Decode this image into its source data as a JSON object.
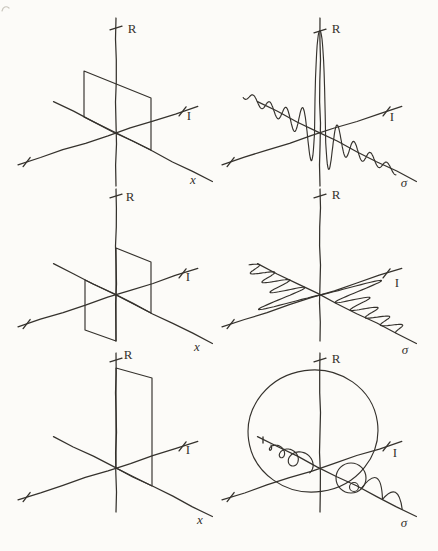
{
  "figure": {
    "background": "#fcfbf8",
    "ink": "#35322d",
    "grid": {
      "columns": 2,
      "rows": 3
    },
    "panels": [
      {
        "name": "even-rectangle-signal",
        "origin": [
          116,
          133
        ],
        "axes": {
          "r_up": 115,
          "r_down": 53,
          "i_pos": 86,
          "i_neg": 103,
          "d_pos": 108,
          "d_neg": 70
        },
        "ticks": {
          "r": -105,
          "i_pos": 70,
          "i_neg": -94
        },
        "labels": {
          "vertical": "R",
          "horizontal": "I",
          "depth": "x"
        },
        "label_pos": {
          "vertical": [
            16,
            -103
          ],
          "horizontal": [
            73,
            -16
          ],
          "depth": [
            77,
            48
          ]
        },
        "curve": {
          "kind": "polygon",
          "points": [
            [
              -32,
              -16
            ],
            [
              -32,
              -62
            ],
            [
              35,
              -35
            ],
            [
              35,
              17
            ]
          ]
        }
      },
      {
        "name": "sinc-transform",
        "origin": [
          320,
          133
        ],
        "axes": {
          "r_up": 115,
          "r_down": 53,
          "i_pos": 86,
          "i_neg": 103,
          "d_pos": 108,
          "d_neg": 70
        },
        "ticks": {
          "r": -102,
          "i_pos": 70,
          "i_neg": -94
        },
        "labels": {
          "vertical": "R",
          "horizontal": "I",
          "depth": "σ"
        },
        "label_pos": {
          "vertical": [
            16,
            -103
          ],
          "horizontal": [
            72,
            -15
          ],
          "depth": [
            84,
            51
          ]
        },
        "curve": {
          "kind": "spike-sinc",
          "amplitude": 102,
          "spike_half_width": 6,
          "zero_spacing": 9.2,
          "envelope": 3.2,
          "t_min": -86,
          "t_max": 85
        }
      },
      {
        "name": "odd-rectangle-signal",
        "origin": [
          116,
          295
        ],
        "axes": {
          "r_up": 106,
          "r_down": 46,
          "i_pos": 86,
          "i_neg": 103,
          "d_pos": 108,
          "d_neg": 70
        },
        "ticks": {
          "r": -99,
          "i_pos": 70,
          "i_neg": -94
        },
        "labels": {
          "vertical": "R",
          "horizontal": "I",
          "depth": "x"
        },
        "label_pos": {
          "vertical": [
            14,
            -97
          ],
          "horizontal": [
            72,
            -17
          ],
          "depth": [
            81,
            53
          ]
        },
        "curve": {
          "kind": "polygons",
          "polygons": [
            [
              [
                0,
                0
              ],
              [
                0,
                -47
              ],
              [
                35,
                -33
              ],
              [
                35,
                18
              ]
            ],
            [
              [
                0,
                0
              ],
              [
                -31,
                -15
              ],
              [
                -31,
                35
              ],
              [
                0,
                46
              ]
            ]
          ]
        }
      },
      {
        "name": "odd-imaginary-transform",
        "origin": [
          320,
          295
        ],
        "axes": {
          "r_up": 106,
          "r_down": 46,
          "i_pos": 86,
          "i_neg": 103,
          "d_pos": 108,
          "d_neg": 70
        },
        "ticks": {
          "r": -99,
          "i_pos": 70,
          "i_neg": -94
        },
        "labels": {
          "vertical": "R",
          "horizontal": "I",
          "depth": "σ"
        },
        "label_pos": {
          "vertical": [
            16,
            -99
          ],
          "horizontal": [
            77,
            -11
          ],
          "depth": [
            85,
            56
          ]
        },
        "curve": {
          "kind": "odd-lobes",
          "amplitude": 55,
          "period": 17,
          "envelope_power": 0.6,
          "t_min": -72,
          "t_max": 84
        }
      },
      {
        "name": "step-rectangle-signal",
        "origin": [
          116,
          468
        ],
        "axes": {
          "r_up": 115,
          "r_down": 44,
          "i_pos": 86,
          "i_neg": 103,
          "d_pos": 108,
          "d_neg": 70
        },
        "ticks": {
          "r": -108,
          "i_pos": 70,
          "i_neg": -94
        },
        "labels": {
          "vertical": "R",
          "horizontal": "I",
          "depth": "x"
        },
        "label_pos": {
          "vertical": [
            12,
            -112
          ],
          "horizontal": [
            72,
            -17
          ],
          "depth": [
            84,
            53
          ]
        },
        "curve": {
          "kind": "polygon",
          "points": [
            [
              0,
              0
            ],
            [
              0,
              -100
            ],
            [
              36,
              -90
            ],
            [
              36,
              18
            ]
          ]
        }
      },
      {
        "name": "spiral-transform",
        "origin": [
          320,
          468
        ],
        "axes": {
          "r_up": 115,
          "r_down": 44,
          "i_pos": 86,
          "i_neg": 103,
          "d_pos": 108,
          "d_neg": 70
        },
        "ticks": {
          "r": -108,
          "i_pos": 70,
          "i_neg": -94
        },
        "labels": {
          "vertical": "R",
          "horizontal": "I",
          "depth": "σ"
        },
        "label_pos": {
          "vertical": [
            16,
            -108
          ],
          "horizontal": [
            75,
            -14
          ],
          "depth": [
            84,
            56
          ]
        },
        "curve": {
          "kind": "spiral",
          "big_loop": {
            "center": [
              -7,
              -37
            ],
            "rx": 65,
            "ry": 61,
            "rotation": -8
          },
          "corkscrew": {
            "t_start": -17,
            "advance": 13,
            "radius": 10.5,
            "decay": 0.68,
            "turns": 3,
            "drop": 3
          },
          "end_dash": [
            -57,
            -28
          ],
          "medium_loop": {
            "center": [
              31,
              10
            ],
            "r": 15
          },
          "tiny_loop": {
            "center": [
              34,
              19
            ],
            "r": 4.5
          },
          "humps": [
            {
              "t1": 46,
              "t2": 70,
              "h": 15
            },
            {
              "t1": 70,
              "t2": 92,
              "h": 11
            }
          ]
        }
      }
    ]
  }
}
